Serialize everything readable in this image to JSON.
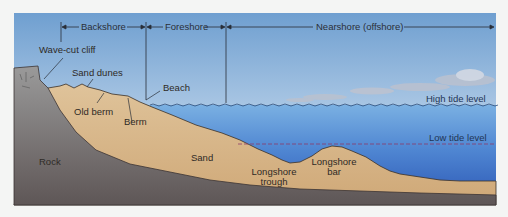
{
  "diagram": {
    "zones": [
      {
        "label": "Backshore"
      },
      {
        "label": "Foreshore"
      },
      {
        "label": "Nearshore (offshore)"
      }
    ],
    "labels": {
      "wave_cut_cliff": "Wave-cut cliff",
      "sand_dunes": "Sand dunes",
      "beach": "Beach",
      "old_berm": "Old berm",
      "berm": "Berm",
      "rock": "Rock",
      "sand": "Sand",
      "longshore_trough_1": "Longshore",
      "longshore_trough_2": "trough",
      "longshore_bar_1": "Longshore",
      "longshore_bar_2": "bar",
      "high_tide": "High tide level",
      "low_tide": "Low tide level"
    },
    "colors": {
      "sky_top": "#6f9fd0",
      "sky_bottom": "#e4eef7",
      "water_top": "#6aa4db",
      "water_bottom": "#2f5fbf",
      "sand": "#d9b98b",
      "rock": "#6f6a6a",
      "low_tide_line": "#8a3a6a"
    }
  }
}
